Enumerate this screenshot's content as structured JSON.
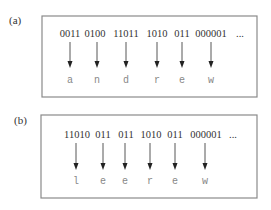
{
  "panels": [
    {
      "label": "(a)",
      "ellipsis": "...",
      "items": [
        {
          "code": "0011",
          "letter": "a"
        },
        {
          "code": "0100",
          "letter": "n"
        },
        {
          "code": "11011",
          "letter": "d"
        },
        {
          "code": "1010",
          "letter": "r"
        },
        {
          "code": "011",
          "letter": "e"
        },
        {
          "code": "000001",
          "letter": "w"
        }
      ]
    },
    {
      "label": "(b)",
      "ellipsis": "...",
      "items": [
        {
          "code": "11010",
          "letter": "l"
        },
        {
          "code": "011",
          "letter": "e"
        },
        {
          "code": "011",
          "letter": "e"
        },
        {
          "code": "1010",
          "letter": "r"
        },
        {
          "code": "011",
          "letter": "e"
        },
        {
          "code": "000001",
          "letter": "w"
        }
      ]
    }
  ]
}
